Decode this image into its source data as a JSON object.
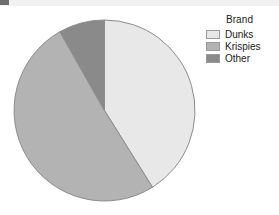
{
  "chart_data": {
    "type": "pie",
    "title": "",
    "legend_title": "Brand",
    "legend_position": "right",
    "categories": [
      "Dunks",
      "Krispies",
      "Other"
    ],
    "values": [
      41,
      51,
      8
    ],
    "unit": "percent",
    "start_angle_deg": 0,
    "direction": "clockwise",
    "slices": [
      {
        "label": "Dunks",
        "value": 41,
        "start_deg": 0,
        "end_deg": 148,
        "color": "#e8e8e8"
      },
      {
        "label": "Krispies",
        "value": 51,
        "start_deg": 148,
        "end_deg": 330.5,
        "color": "#b3b3b3"
      },
      {
        "label": "Other",
        "value": 8,
        "start_deg": 330.5,
        "end_deg": 360,
        "color": "#8a8a8a"
      }
    ],
    "slice_outline_color": "#8c8c8c",
    "background": "#ffffff"
  },
  "legend": {
    "title": "Brand",
    "items": [
      {
        "label": "Dunks",
        "color": "#e8e8e8"
      },
      {
        "label": "Krispies",
        "color": "#b3b3b3"
      },
      {
        "label": "Other",
        "color": "#8a8a8a"
      }
    ]
  }
}
